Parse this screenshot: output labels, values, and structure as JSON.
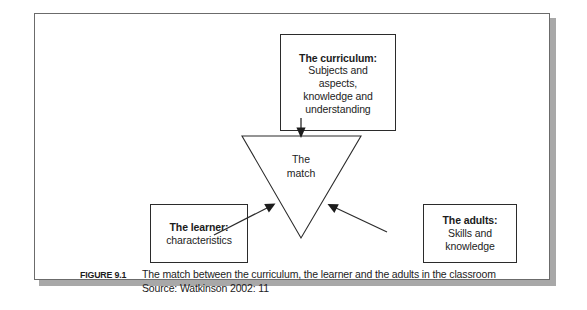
{
  "figure": {
    "panel_background": "#ffffff",
    "border_color": "#6b6b6b",
    "shadow_color": "#a8a8a8",
    "ink_color": "#1c1c1c"
  },
  "diagram": {
    "curriculum": {
      "title": "The curriculum:",
      "lines": [
        "Subjects and",
        "aspects,",
        "knowledge and",
        "understanding"
      ]
    },
    "learner": {
      "title": "The learner:",
      "lines": [
        "characteristics"
      ]
    },
    "adults": {
      "title": "The adults:",
      "lines": [
        "Skills and",
        "knowledge"
      ]
    },
    "match": {
      "line1": "The",
      "line2": "match"
    }
  },
  "caption": {
    "figure_label": "FIGURE 9.1",
    "title": "The match between the curriculum, the learner and the adults in the classroom",
    "source": "Source: Watkinson 2002: 11"
  }
}
